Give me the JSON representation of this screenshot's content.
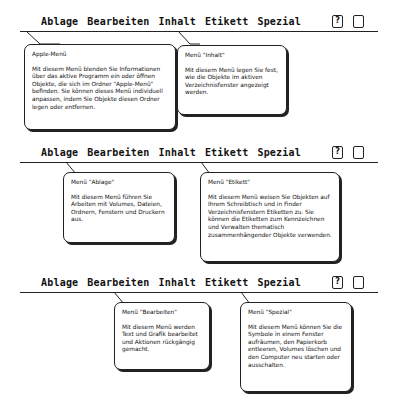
{
  "menubar": {
    "apple_icon": "apple-icon",
    "items": [
      "Ablage",
      "Bearbeiten",
      "Inhalt",
      "Etikett",
      "Spezial"
    ],
    "right_icons": [
      "help-balloon-icon",
      "finder-app-icon"
    ]
  },
  "panels": [
    {
      "bubbles": [
        {
          "title": "Apple-Menü",
          "body": "Mit diesem Menü blenden Sie Informationen über das aktive Programm ein oder öffnen Objekte, die sich im Ordner \"Apple-Menü\" befinden. Sie können dieses Menü individuell anpassen, indem Sie Objekte diesen Ordner legen oder entfernen."
        },
        {
          "title": "Menü \"Inhalt\"",
          "body": "Mit diesem Menü legen Sie fest, wie die Objekte im aktiven Verzeichnisfenster angezeigt werden."
        }
      ]
    },
    {
      "bubbles": [
        {
          "title": "Menü \"Ablage\"",
          "body": "Mit diesem Menü führen Sie Arbeiten mit Volumes, Dateien, Ordnern, Fenstern und Druckern aus."
        },
        {
          "title": "Menü \"Etikett\"",
          "body": "Mit diesem Menü weisen Sie Objekten auf Ihrem Schreibtisch und in Finder Verzeichnisfenstern Etiketten zu. Sie können die Etiketten zum Kennzeichnen und Verwalten thematisch zusammenhängender Objekte verwenden."
        }
      ]
    },
    {
      "bubbles": [
        {
          "title": "Menü \"Bearbeiten\"",
          "body": "Mit diesem Menü werden Text und Grafik bearbeitet und Aktionen rückgängig gemacht."
        },
        {
          "title": "Menü \"Spezial\"",
          "body": "Mit diesem Menü können Sie die Symbole in einem Fenster aufräumen, den Papierkorb entleeren, Volumes löschen und den Computer neu starten oder ausschalten."
        }
      ]
    }
  ]
}
